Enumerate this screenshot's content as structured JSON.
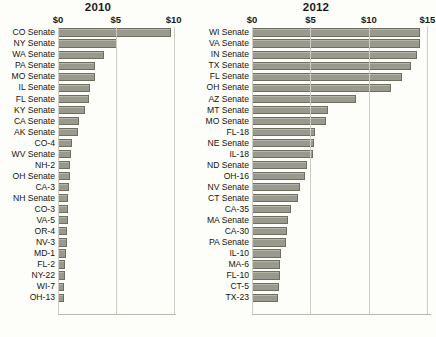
{
  "figure": {
    "background_color": "#fdfdfa",
    "bar_fill": "#9a998d",
    "bar_stroke": "#6f6e63",
    "gridline_color": "#cdcdc4"
  },
  "chart_data": [
    {
      "type": "bar",
      "orientation": "horizontal",
      "title": "2010",
      "xlabel": "",
      "ylabel": "",
      "xlim": [
        0,
        10.2
      ],
      "xticks": [
        0,
        5,
        10
      ],
      "xticklabels": [
        "$0",
        "$5",
        "$10"
      ],
      "grid": true,
      "legend": "none",
      "units": "millions of dollars",
      "categories": [
        "CO Senate",
        "NY Senate",
        "WA Senate",
        "PA Senate",
        "MO Senate",
        "IL Senate",
        "FL Senate",
        "KY Senate",
        "CA Senate",
        "AK Senate",
        "CO-4",
        "WV Senate",
        "NH-2",
        "OH Senate",
        "CA-3",
        "NH Senate",
        "CO-3",
        "VA-5",
        "OR-4",
        "NV-3",
        "MD-1",
        "FL-2",
        "NY-22",
        "WI-7",
        "OH-13"
      ],
      "values": [
        9.8,
        5.1,
        4.0,
        3.2,
        3.2,
        2.8,
        2.7,
        2.3,
        1.8,
        1.7,
        1.2,
        1.1,
        1.0,
        1.0,
        0.95,
        0.9,
        0.85,
        0.85,
        0.8,
        0.8,
        0.7,
        0.6,
        0.6,
        0.55,
        0.5
      ]
    },
    {
      "type": "bar",
      "orientation": "horizontal",
      "title": "2012",
      "xlabel": "",
      "ylabel": "",
      "xlim": [
        0,
        15.3
      ],
      "xticks": [
        0,
        5,
        10,
        15
      ],
      "xticklabels": [
        "$0",
        "$5",
        "$10",
        "$15"
      ],
      "grid": true,
      "legend": "none",
      "units": "millions of dollars",
      "categories": [
        "WI Senate",
        "VA Senate",
        "IN Senate",
        "TX Senate",
        "FL Senate",
        "OH Senate",
        "AZ Senate",
        "MT Senate",
        "MO Senate",
        "FL-18",
        "NE Senate",
        "IL-18",
        "ND Senate",
        "OH-16",
        "NV Senate",
        "CT Senate",
        "CA-35",
        "MA Senate",
        "CA-30",
        "PA Senate",
        "IL-10",
        "MA-6",
        "FL-10",
        "CT-5",
        "TX-23"
      ],
      "values": [
        14.4,
        14.4,
        14.1,
        13.6,
        12.8,
        11.9,
        8.9,
        6.5,
        6.3,
        5.4,
        5.3,
        5.2,
        4.7,
        4.5,
        4.1,
        3.9,
        3.3,
        3.1,
        3.0,
        2.9,
        2.5,
        2.4,
        2.4,
        2.3,
        2.2
      ]
    }
  ]
}
